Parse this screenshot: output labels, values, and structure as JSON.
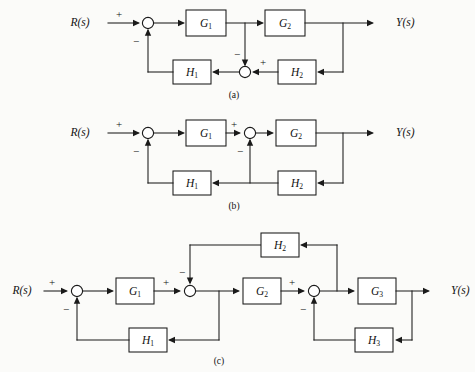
{
  "figure": {
    "background_color": "#fbfbf9",
    "line_color": "#1a1a1a"
  },
  "diagrams": [
    {
      "id": "a",
      "caption": "(a)",
      "input_label": "R(s)",
      "output_label": "Y(s)",
      "blocks": [
        {
          "name": "G1",
          "label": "G",
          "sub": "1"
        },
        {
          "name": "G2",
          "label": "G",
          "sub": "2"
        },
        {
          "name": "H1",
          "label": "H",
          "sub": "1"
        },
        {
          "name": "H2",
          "label": "H",
          "sub": "2"
        }
      ],
      "summing_junctions": [
        {
          "name": "sum-1",
          "signs": [
            {
              "position": "left",
              "sign": "+"
            },
            {
              "position": "bottom",
              "sign": "−"
            }
          ]
        },
        {
          "name": "sum-2",
          "signs": [
            {
              "position": "top",
              "sign": "−"
            },
            {
              "position": "right",
              "sign": "+"
            }
          ]
        }
      ]
    },
    {
      "id": "b",
      "caption": "(b)",
      "input_label": "R(s)",
      "output_label": "Y(s)",
      "blocks": [
        {
          "name": "G1",
          "label": "G",
          "sub": "1"
        },
        {
          "name": "G2",
          "label": "G",
          "sub": "2"
        },
        {
          "name": "H1",
          "label": "H",
          "sub": "1"
        },
        {
          "name": "H2",
          "label": "H",
          "sub": "2"
        }
      ],
      "summing_junctions": [
        {
          "name": "sum-1",
          "signs": [
            {
              "position": "left",
              "sign": "+"
            },
            {
              "position": "bottom",
              "sign": "−"
            }
          ]
        },
        {
          "name": "sum-2",
          "signs": [
            {
              "position": "left",
              "sign": "+"
            },
            {
              "position": "bottom",
              "sign": "−"
            }
          ]
        }
      ]
    },
    {
      "id": "c",
      "caption": "(c)",
      "input_label": "R(s)",
      "output_label": "Y(s)",
      "blocks": [
        {
          "name": "G1",
          "label": "G",
          "sub": "1"
        },
        {
          "name": "G2",
          "label": "G",
          "sub": "2"
        },
        {
          "name": "G3",
          "label": "G",
          "sub": "3"
        },
        {
          "name": "H1",
          "label": "H",
          "sub": "1"
        },
        {
          "name": "H2",
          "label": "H",
          "sub": "2"
        },
        {
          "name": "H3",
          "label": "H",
          "sub": "3"
        }
      ],
      "summing_junctions": [
        {
          "name": "sum-1",
          "signs": [
            {
              "position": "left",
              "sign": "+"
            },
            {
              "position": "bottom",
              "sign": "−"
            }
          ]
        },
        {
          "name": "sum-2",
          "signs": [
            {
              "position": "left",
              "sign": "+"
            },
            {
              "position": "top",
              "sign": "−"
            }
          ]
        },
        {
          "name": "sum-3",
          "signs": [
            {
              "position": "left",
              "sign": "+"
            },
            {
              "position": "bottom",
              "sign": "−"
            }
          ]
        }
      ]
    }
  ]
}
